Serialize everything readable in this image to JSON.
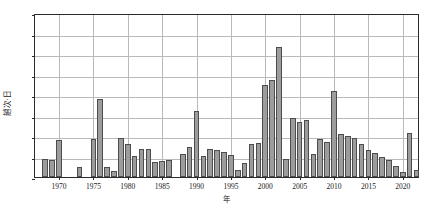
{
  "chart_data": {
    "type": "bar",
    "title": "",
    "xlabel": "年",
    "ylabel": "趟次·日",
    "ylim": [
      0,
      200
    ],
    "ytick_values": [
      0,
      25,
      50,
      75,
      100,
      125,
      150,
      175,
      200
    ],
    "ytick_labels": [
      "0",
      "25",
      "50",
      "75",
      "100",
      "125",
      "150",
      "175",
      "200"
    ],
    "xlim": [
      1966.5,
      2022.5
    ],
    "xtick_values": [
      1970,
      1975,
      1980,
      1985,
      1990,
      1995,
      2000,
      2005,
      2010,
      2015,
      2020
    ],
    "xtick_labels": [
      "1970",
      "1975",
      "1980",
      "1985",
      "1990",
      "1995",
      "2000",
      "2005",
      "2010",
      "2015",
      "2020"
    ],
    "grid": "horizontal-and-vertical",
    "legend": "none",
    "bar_face_color": "#9c9c9c",
    "bar_edge_color": "#4d4d4d",
    "axis_color": "#2b2b2b",
    "grid_color": "#b9b9b9",
    "categories": [
      1967,
      1968,
      1969,
      1970,
      1971,
      1972,
      1973,
      1974,
      1975,
      1976,
      1977,
      1978,
      1979,
      1980,
      1981,
      1982,
      1983,
      1984,
      1985,
      1986,
      1987,
      1988,
      1989,
      1990,
      1991,
      1992,
      1993,
      1994,
      1995,
      1996,
      1997,
      1998,
      1999,
      2000,
      2001,
      2002,
      2003,
      2004,
      2005,
      2006,
      2007,
      2008,
      2009,
      2010,
      2011,
      2012,
      2013,
      2014,
      2015,
      2016,
      2017,
      2018,
      2019,
      2020,
      2021,
      2022
    ],
    "values": [
      0,
      22,
      21,
      45,
      0,
      0,
      12,
      0,
      46,
      95,
      12,
      7,
      48,
      40,
      26,
      34,
      34,
      18,
      20,
      21,
      0,
      28,
      37,
      81,
      26,
      34,
      33,
      30,
      27,
      8,
      17,
      40,
      41,
      112,
      118,
      159,
      22,
      72,
      67,
      69,
      28,
      46,
      43,
      105,
      52,
      50,
      47,
      40,
      33,
      29,
      24,
      21,
      14,
      6,
      54,
      8
    ],
    "xlabel_unit": "年",
    "ylabel_unit": "趟次·日"
  }
}
